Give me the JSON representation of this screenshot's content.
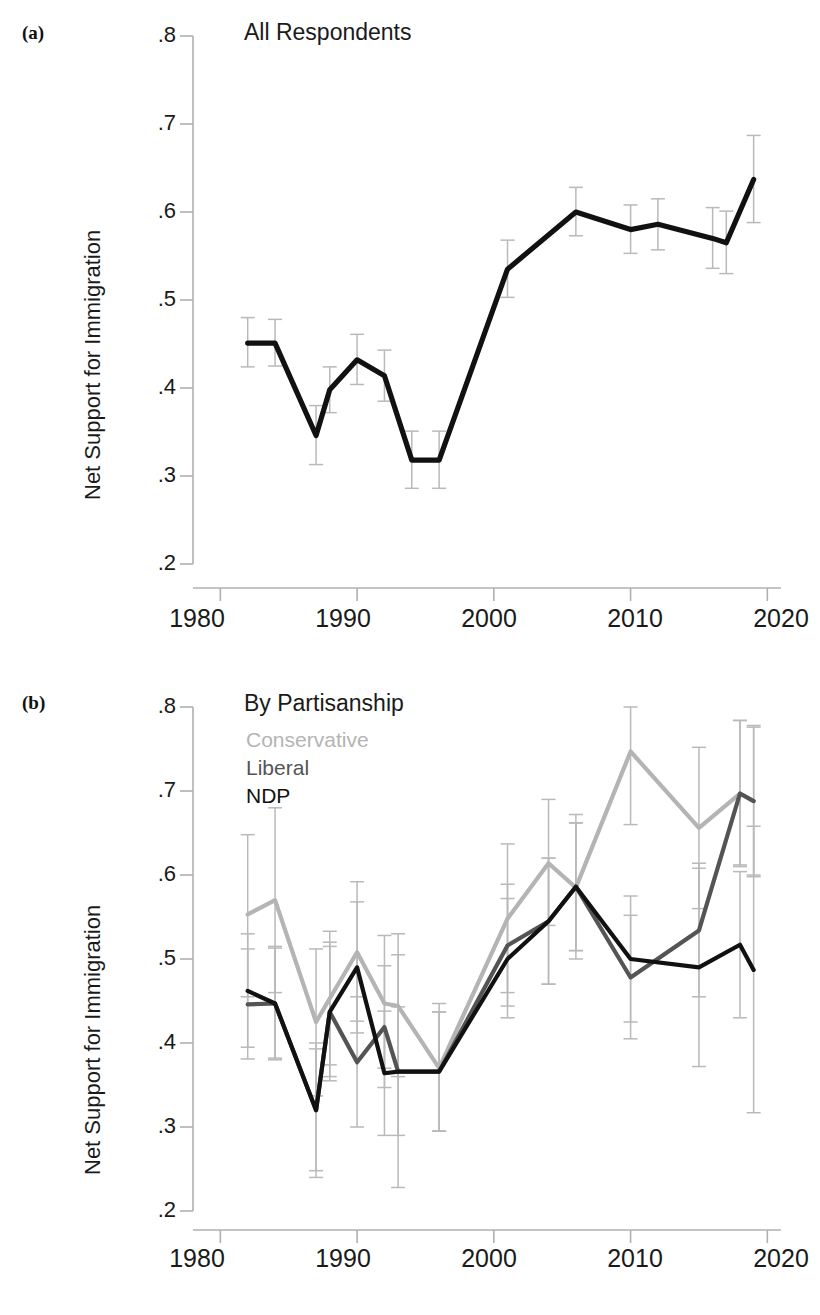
{
  "figure": {
    "width": 820,
    "height": 1315,
    "background": "#ffffff"
  },
  "panels": [
    {
      "tag": "(a)",
      "title": "All Respondents",
      "ylabel": "Net Support for Immigration"
    },
    {
      "tag": "(b)",
      "title": "By Partisanship",
      "ylabel": "Net Support for Immigration"
    }
  ],
  "legend": {
    "position": "top-left-inside",
    "entries": [
      {
        "label": "Conservative",
        "color": "#b4b4b4"
      },
      {
        "label": "Liberal",
        "color": "#545454"
      },
      {
        "label": "NDP",
        "color": "#111111"
      }
    ]
  },
  "axes": {
    "y_ticks": [
      ".8",
      ".7",
      ".6",
      ".5",
      ".4",
      ".3",
      ".2"
    ],
    "y_tick_values": [
      0.8,
      0.7,
      0.6,
      0.5,
      0.4,
      0.3,
      0.2
    ],
    "x_ticks": [
      "1980",
      "1990",
      "2000",
      "2010",
      "2020"
    ],
    "x_tick_values": [
      1980,
      1990,
      2000,
      2010,
      2020
    ],
    "xlim": [
      1978,
      2021
    ],
    "ylim": [
      0.2,
      0.8
    ],
    "grid": false,
    "errorbar_color": "#b9b9b9"
  },
  "chart_data": [
    {
      "type": "line",
      "panel": "(a)",
      "title": "All Respondents",
      "xlabel": "",
      "ylabel": "Net Support for Immigration",
      "xlim": [
        1978,
        2021
      ],
      "ylim": [
        0.2,
        0.8
      ],
      "grid": false,
      "legend_position": "none",
      "error_bars": true,
      "series": [
        {
          "name": "All Respondents",
          "color": "#111111",
          "x": [
            1982,
            1984,
            1987,
            1988,
            1990,
            1992,
            1994,
            1996,
            2001,
            2006,
            2010,
            2012,
            2016,
            2017,
            2019
          ],
          "values": [
            0.451,
            0.451,
            0.346,
            0.398,
            0.432,
            0.414,
            0.318,
            0.318,
            0.535,
            0.6,
            0.58,
            0.586,
            0.57,
            0.565,
            0.637
          ],
          "err_low": [
            0.424,
            0.425,
            0.313,
            0.372,
            0.404,
            0.385,
            0.286,
            0.286,
            0.503,
            0.573,
            0.553,
            0.557,
            0.536,
            0.53,
            0.588
          ],
          "err_high": [
            0.48,
            0.478,
            0.38,
            0.424,
            0.461,
            0.443,
            0.351,
            0.351,
            0.568,
            0.628,
            0.608,
            0.615,
            0.605,
            0.601,
            0.687
          ]
        }
      ]
    },
    {
      "type": "line",
      "panel": "(b)",
      "title": "By Partisanship",
      "xlabel": "",
      "ylabel": "Net Support for Immigration",
      "xlim": [
        1978,
        2021
      ],
      "ylim": [
        0.2,
        0.8
      ],
      "grid": false,
      "legend_position": "top-left-inside",
      "error_bars": true,
      "series": [
        {
          "name": "Conservative",
          "color": "#b4b4b4",
          "x": [
            1982,
            1984,
            1987,
            1988,
            1990,
            1992,
            1993,
            1996,
            2001,
            2004,
            2006,
            2010,
            2015,
            2018,
            2019
          ],
          "values": [
            0.553,
            0.57,
            0.425,
            0.453,
            0.508,
            0.447,
            0.444,
            0.37,
            0.548,
            0.614,
            0.585,
            0.747,
            0.656,
            0.697,
            0.688
          ],
          "err_low": [
            0.455,
            0.46,
            0.337,
            0.374,
            0.426,
            0.37,
            0.36,
            0.295,
            0.46,
            0.54,
            0.5,
            0.66,
            0.56,
            0.612,
            0.6
          ],
          "err_high": [
            0.648,
            0.68,
            0.512,
            0.533,
            0.592,
            0.528,
            0.53,
            0.447,
            0.637,
            0.69,
            0.672,
            0.835,
            0.752,
            0.784,
            0.776
          ]
        },
        {
          "name": "Liberal",
          "color": "#545454",
          "x": [
            1982,
            1984,
            1987,
            1988,
            1990,
            1992,
            1993,
            1996,
            2001,
            2004,
            2006,
            2010,
            2015,
            2018,
            2019
          ],
          "values": [
            0.446,
            0.447,
            0.32,
            0.437,
            0.377,
            0.419,
            0.366,
            0.366,
            0.516,
            0.545,
            0.586,
            0.478,
            0.534,
            0.697,
            0.688
          ],
          "err_low": [
            0.381,
            0.382,
            0.248,
            0.36,
            0.3,
            0.347,
            0.29,
            0.295,
            0.444,
            0.47,
            0.51,
            0.405,
            0.455,
            0.61,
            0.598
          ],
          "err_high": [
            0.512,
            0.513,
            0.393,
            0.515,
            0.455,
            0.492,
            0.443,
            0.437,
            0.589,
            0.62,
            0.662,
            0.552,
            0.614,
            0.784,
            0.778
          ]
        },
        {
          "name": "NDP",
          "color": "#111111",
          "x": [
            1982,
            1984,
            1987,
            1988,
            1990,
            1992,
            1993,
            1996,
            2001,
            2004,
            2006,
            2010,
            2015,
            2018,
            2019
          ],
          "values": [
            0.462,
            0.447,
            0.32,
            0.437,
            0.49,
            0.364,
            0.366,
            0.366,
            0.5,
            0.545,
            0.586,
            0.5,
            0.49,
            0.517,
            0.487
          ],
          "err_low": [
            0.395,
            0.38,
            0.24,
            0.355,
            0.412,
            0.29,
            0.228,
            0.295,
            0.43,
            0.47,
            0.51,
            0.425,
            0.372,
            0.43,
            0.317
          ],
          "err_high": [
            0.53,
            0.515,
            0.4,
            0.52,
            0.568,
            0.438,
            0.505,
            0.437,
            0.572,
            0.62,
            0.662,
            0.575,
            0.608,
            0.604,
            0.658
          ]
        }
      ]
    }
  ]
}
